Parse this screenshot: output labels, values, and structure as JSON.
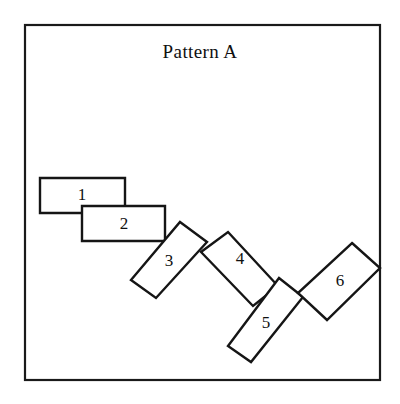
{
  "figure": {
    "title": "Pattern A",
    "title_position": {
      "x": 200,
      "y": 58
    },
    "background_color": "#ffffff",
    "ink_color": "#151515"
  },
  "frame": {
    "name": "outer-border",
    "x": 25,
    "y": 25,
    "width": 355,
    "height": 355,
    "stroke_color": "#1a1a1a",
    "stroke_width": 2.2
  },
  "chart_data": {
    "type": "diagram",
    "title": "Pattern A",
    "xlabel": "",
    "ylabel": "",
    "xlim": [
      25,
      380
    ],
    "ylim": [
      25,
      380
    ],
    "grid": false,
    "legend": "none",
    "categories": [
      "1",
      "2",
      "3",
      "4",
      "5",
      "6"
    ],
    "tiles": [
      {
        "label": "1",
        "points": "40,178 125,178 125,213 40,213",
        "label_x": 82,
        "label_y": 196,
        "angle_deg": 0,
        "tile_width": 85,
        "tile_height": 35
      },
      {
        "label": "2",
        "points": "82,206 165,206 165,241 82,241",
        "label_x": 124,
        "label_y": 225,
        "angle_deg": 0,
        "tile_width": 83,
        "tile_height": 35
      },
      {
        "label": "3",
        "points": "180,222 207,242 156,298 131,280",
        "label_x": 169,
        "label_y": 262,
        "angle_deg": 58,
        "tile_width": 85,
        "tile_height": 34
      },
      {
        "label": "4",
        "points": "228,232 278,286 253,306 201,252",
        "label_x": 240,
        "label_y": 260,
        "angle_deg": -43,
        "tile_width": 74,
        "tile_height": 34
      },
      {
        "label": "5",
        "points": "279,278 303,297 251,362 228,346",
        "label_x": 266,
        "label_y": 324,
        "angle_deg": 58,
        "tile_width": 85,
        "tile_height": 32
      },
      {
        "label": "6",
        "points": "352,243 380,268 327,320 298,293",
        "label_x": 340,
        "label_y": 282,
        "angle_deg": -44,
        "tile_width": 75,
        "tile_height": 38
      }
    ]
  }
}
